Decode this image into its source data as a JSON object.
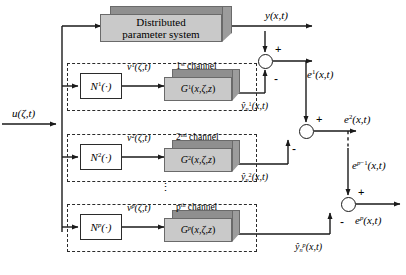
{
  "diagram": {
    "colors": {
      "block_face": "#c9c9c9",
      "block_top": "#8f8f8f",
      "block_side": "#9c9c9c",
      "line": "#1a1a1a",
      "dash": "#2b2b2b",
      "background": "#ffffff"
    }
  },
  "plant": {
    "line1": "Distributed",
    "line2": "parameter system"
  },
  "input": {
    "label_html": "<i>u</i>(<i>&zeta;</i>,<i>t</i>)",
    "label_text": "u(ζ,t)"
  },
  "output": {
    "label_html": "<i>y</i>(<i>x</i>,<i>t</i>)",
    "label_text": "y(x,t)"
  },
  "channels": [
    {
      "id": "channel-1",
      "header_html": "1<sup>st</sup> channel",
      "header_text": "1st channel",
      "nonlinear_html": "<i>N</i><sup>1</sup>(&middot;)",
      "nonlinear_text": "N¹(·)",
      "intermediate_html": "<i>v</i><sup>1</sup>(<i>&zeta;</i>,<i>t</i>)",
      "intermediate_text": "v¹(ζ,t)",
      "linear_html": "<i>G</i><sup>1</sup>(<i>x</i>,<i>&zeta;</i>,<i>z</i>)",
      "linear_text": "G¹(x,ζ,z)",
      "estimate_html": "<i>&ycirc;</i><sub><i>n</i></sub><sup>1</sup>(<i>x</i>,<i>t</i>)",
      "estimate_text": "ŷ¹ₙ(x,t)"
    },
    {
      "id": "channel-2",
      "header_html": "2<sup>nd</sup> channel",
      "header_text": "2nd channel",
      "nonlinear_html": "<i>N</i><sup>2</sup>(&middot;)",
      "nonlinear_text": "N²(·)",
      "intermediate_html": "<i>v</i><sup>2</sup>(<i>&zeta;</i>,<i>t</i>)",
      "intermediate_text": "v²(ζ,t)",
      "linear_html": "<i>G</i><sup>2</sup>(<i>x</i>,<i>&zeta;</i>,<i>z</i>)",
      "linear_text": "G²(x,ζ,z)",
      "estimate_html": "<i>&ycirc;</i><sub><i>n</i></sub><sup>2</sup>(<i>x</i>,<i>t</i>)",
      "estimate_text": "ŷ²ₙ(x,t)"
    },
    {
      "id": "channel-p",
      "header_html": "p<sup>th</sup> channel",
      "header_text": "pth channel",
      "nonlinear_html": "<i>N</i><sup><i>p</i></sup>(&middot;)",
      "nonlinear_text": "Nᵖ(·)",
      "intermediate_html": "<i>v</i><sup><i>p</i></sup>(<i>&zeta;</i>,<i>t</i>)",
      "intermediate_text": "vᵖ(ζ,t)",
      "linear_html": "<i>G</i><sup><i>p</i></sup>(<i>x</i>,<i>&zeta;</i>,<i>z</i>)",
      "linear_text": "Gᵖ(x,ζ,z)",
      "estimate_html": "<i>&ycirc;</i><sub><i>n</i></sub><sup><i>p</i></sup>(<i>x</i>,<i>t</i>)",
      "estimate_text": "ŷᵖₙ(x,t)"
    }
  ],
  "errors": [
    {
      "id": "error-1",
      "label_html": "<i>e</i><sup>1</sup>(<i>x</i>,<i>t</i>)",
      "label_text": "e¹(x,t)"
    },
    {
      "id": "error-2",
      "label_html": "<i>e</i><sup>2</sup>(<i>x</i>,<i>t</i>)",
      "label_text": "e²(x,t)"
    },
    {
      "id": "error-p-minus-1",
      "label_html": "<i>e</i><sup><i>p</i>&minus;1</sup>(<i>x</i>,<i>t</i>)",
      "label_text": "e^{p-1}(x,t)"
    },
    {
      "id": "error-p",
      "label_html": "<i>e</i><sup><i>p</i></sup>(<i>x</i>,<i>t</i>)",
      "label_text": "eᵖ(x,t)"
    }
  ],
  "signs": {
    "plus": "+",
    "minus": "-"
  },
  "ellipsis": {
    "vertical": "⋮"
  }
}
